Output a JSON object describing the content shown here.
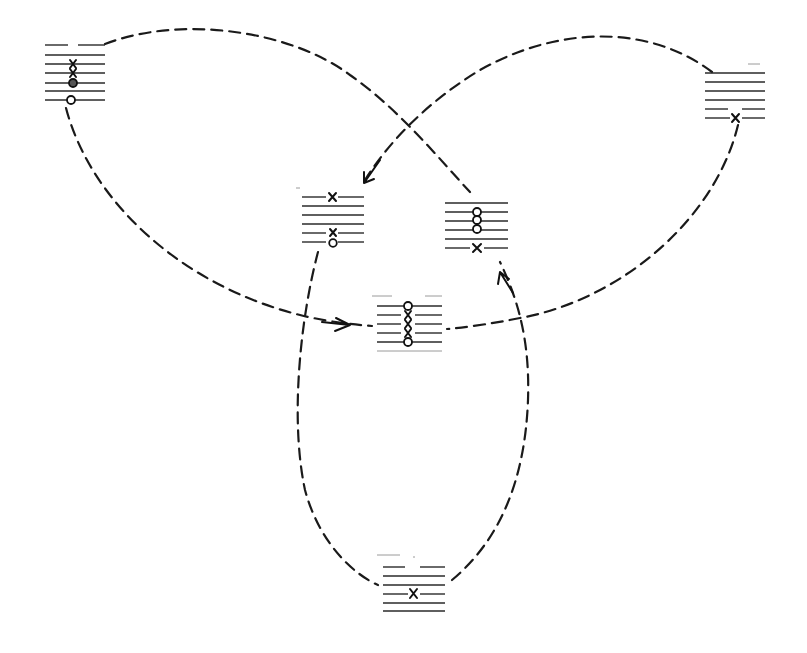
{
  "figure": {
    "colors": {
      "ink": "#1a1a1a",
      "background": "#ffffff"
    }
  },
  "boxes": [
    {
      "id": "A",
      "position": "top-left",
      "x": 45,
      "y": 45,
      "width": 60,
      "lines": 7,
      "markers": [
        {
          "line": 3,
          "type": "x"
        },
        {
          "line": 4,
          "type": "x"
        },
        {
          "line": 5,
          "type": "o-filled"
        },
        {
          "line": 7,
          "type": "o"
        }
      ]
    },
    {
      "id": "B",
      "position": "top-right",
      "x": 705,
      "y": 70,
      "width": 60,
      "lines": 6,
      "markers": [
        {
          "line": 6,
          "type": "x"
        }
      ]
    },
    {
      "id": "C",
      "position": "middle-left",
      "x": 302,
      "y": 197,
      "width": 62,
      "lines": 6,
      "markers": [
        {
          "line": 1,
          "type": "x"
        },
        {
          "line": 5,
          "type": "x"
        },
        {
          "line": 6,
          "type": "o"
        }
      ]
    },
    {
      "id": "D",
      "position": "middle-right",
      "x": 445,
      "y": 203,
      "width": 63,
      "lines": 6,
      "markers": [
        {
          "line": 2,
          "type": "o"
        },
        {
          "line": 3,
          "type": "o"
        },
        {
          "line": 4,
          "type": "o"
        },
        {
          "line": 6,
          "type": "x"
        }
      ]
    },
    {
      "id": "E",
      "position": "center",
      "x": 377,
      "y": 306,
      "width": 65,
      "lines": 6,
      "markers": [
        {
          "line": 1,
          "type": "o"
        },
        {
          "line": 2,
          "type": "x"
        },
        {
          "line": 3,
          "type": "x"
        },
        {
          "line": 4,
          "type": "x"
        },
        {
          "line": 5,
          "type": "o"
        }
      ]
    },
    {
      "id": "F",
      "position": "bottom",
      "x": 383,
      "y": 568,
      "width": 62,
      "lines": 6,
      "markers": [
        {
          "line": 4,
          "type": "x"
        }
      ]
    }
  ],
  "connections": [
    {
      "from": "A",
      "to": "D",
      "style": "dashed",
      "arrow": false
    },
    {
      "from": "A",
      "to": "E",
      "style": "dashed",
      "arrow": true
    },
    {
      "from": "B",
      "to": "C",
      "style": "dashed",
      "arrow": true
    },
    {
      "from": "B",
      "to": "E",
      "style": "dashed",
      "arrow": false
    },
    {
      "from": "C",
      "to": "F",
      "style": "dashed",
      "arrow": false
    },
    {
      "from": "F",
      "to": "D",
      "style": "dashed",
      "arrow": true
    }
  ]
}
